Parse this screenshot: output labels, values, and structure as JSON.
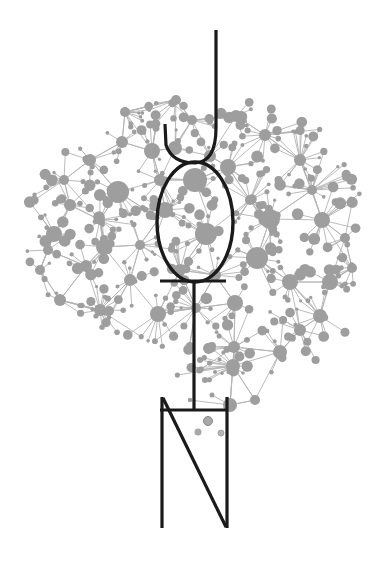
{
  "illustration": {
    "subject": "network-node brain with line-drawn figure overlay",
    "colors": {
      "background": "#ffffff",
      "node": "#9e9e9e",
      "edge": "#b3b3b3",
      "ink": "#1a1a1a"
    },
    "hubs": [
      [
        118,
        192,
        11
      ],
      [
        195,
        180,
        12
      ],
      [
        206,
        234,
        11
      ],
      [
        152,
        151,
        8
      ],
      [
        257,
        258,
        11
      ],
      [
        270,
        219,
        10
      ],
      [
        228,
        167,
        8
      ],
      [
        54,
        234,
        8
      ],
      [
        104,
        247,
        8
      ],
      [
        165,
        210,
        8
      ],
      [
        235,
        303,
        8
      ],
      [
        158,
        314,
        8
      ],
      [
        322,
        220,
        8
      ],
      [
        290,
        282,
        8
      ],
      [
        330,
        282,
        8
      ],
      [
        86,
        266,
        6
      ],
      [
        320,
        316,
        7
      ],
      [
        280,
        352,
        7
      ],
      [
        233,
        366,
        7
      ],
      [
        234,
        347,
        6
      ],
      [
        210,
        156,
        6
      ],
      [
        175,
        148,
        7
      ],
      [
        122,
        142,
        6
      ],
      [
        90,
        160,
        6
      ],
      [
        70,
        205,
        6
      ],
      [
        40,
        270,
        5
      ],
      [
        60,
        300,
        6
      ],
      [
        100,
        310,
        6
      ],
      [
        130,
        280,
        6
      ],
      [
        192,
        120,
        5
      ],
      [
        125,
        112,
        5
      ],
      [
        176,
        100,
        5
      ],
      [
        236,
        116,
        6
      ],
      [
        265,
        135,
        6
      ],
      [
        300,
        160,
        6
      ],
      [
        312,
        190,
        5
      ],
      [
        345,
        238,
        5
      ],
      [
        352,
        268,
        5
      ],
      [
        300,
        330,
        6
      ],
      [
        255,
        400,
        5
      ],
      [
        230,
        405,
        7
      ],
      [
        196,
        308,
        5
      ],
      [
        180,
        270,
        6
      ],
      [
        215,
        275,
        6
      ],
      [
        140,
        245,
        5
      ],
      [
        160,
        180,
        6
      ],
      [
        100,
        220,
        5
      ],
      [
        64,
        180,
        5
      ],
      [
        48,
        250,
        5
      ],
      [
        250,
        200,
        5
      ]
    ],
    "scatter_seed": 42,
    "satellite_count": 420,
    "figure": {
      "hook_top": [
        216,
        30
      ],
      "hook_left_tip": [
        165,
        124
      ],
      "oval": {
        "cx": 195,
        "cy": 222,
        "rx": 38,
        "ry": 60
      },
      "crossbar_y": 281,
      "stem_x": 194,
      "base": {
        "left_x": 160,
        "right_x": 228,
        "top_y": 397,
        "crossbar_y": 410,
        "bottom_y": 528
      }
    }
  }
}
